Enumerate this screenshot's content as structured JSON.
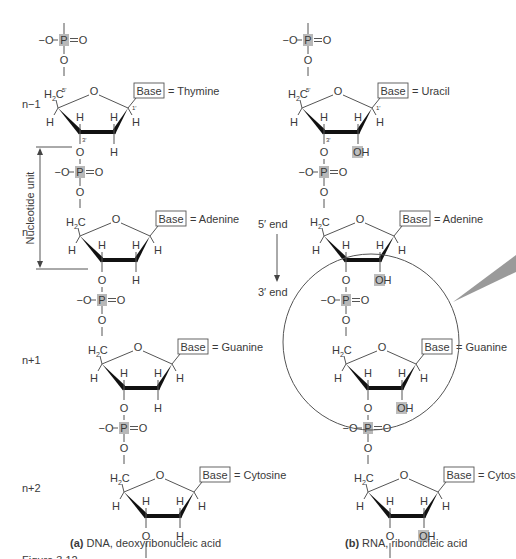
{
  "figure": {
    "panel_a": {
      "caption_letter": "(a)",
      "caption_text": "DNA, deoxyribonucleic acid",
      "nucleotides": [
        {
          "position": "n−1",
          "base_label": "Base",
          "base_name": "= Thymine",
          "c2_sub": "H"
        },
        {
          "position": "n",
          "base_label": "Base",
          "base_name": "= Adenine",
          "c2_sub": "H"
        },
        {
          "position": "n+1",
          "base_label": "Base",
          "base_name": "= Guanine",
          "c2_sub": "H"
        },
        {
          "position": "n+2",
          "base_label": "Base",
          "base_name": "= Cytosine",
          "c2_sub": "H"
        }
      ],
      "bracket_label": "Nucleotide unit"
    },
    "panel_b": {
      "caption_letter": "(b)",
      "caption_text": "RNA, ribonucleic acid",
      "nucleotides": [
        {
          "base_label": "Base",
          "base_name": "= Uracil",
          "c2_sub": "OH"
        },
        {
          "base_label": "Base",
          "base_name": "= Adenine",
          "c2_sub": "OH"
        },
        {
          "base_label": "Base",
          "base_name": "= Guanine",
          "c2_sub": "OH"
        },
        {
          "base_label": "Base",
          "base_name": "= Cytos",
          "c2_sub": "OH"
        }
      ],
      "end_5": "5′ end",
      "end_3": "3′ end"
    },
    "atoms": {
      "O": "O",
      "Ominus": "−O",
      "P": "P",
      "H": "H",
      "C": "C",
      "H2": "H",
      "two": "2",
      "c5": "5′",
      "c3": "3′",
      "c1": "1′"
    },
    "footer_partial": "Figure 3.12"
  }
}
